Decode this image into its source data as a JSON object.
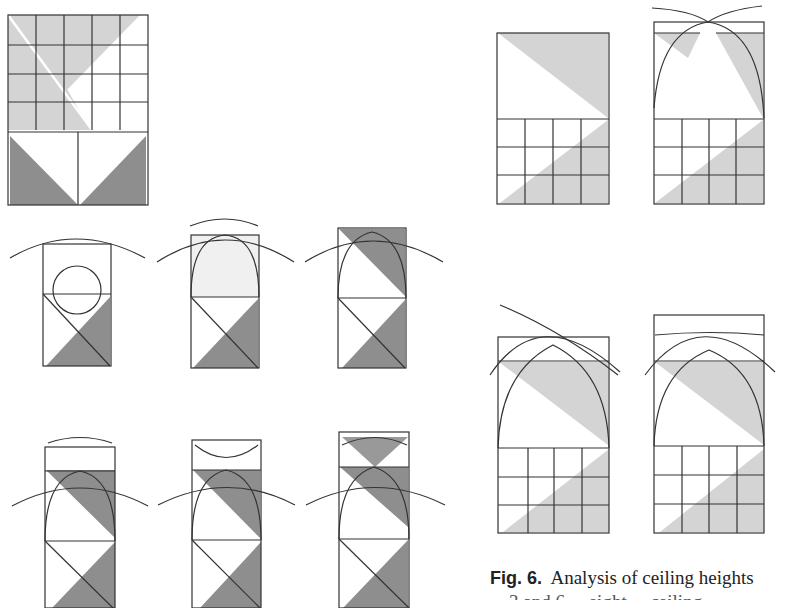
{
  "figure": {
    "label": "Fig. 6.",
    "caption_line1": "Analysis of ceiling heights",
    "caption_line2": "... 3 and 6 ... eight ... ceiling ...",
    "colors": {
      "line": "#333333",
      "light_shade": "#d3d3d3",
      "dark_shade": "#8c8c8c",
      "background": "#ffffff"
    },
    "panels": [
      {
        "id": "A",
        "description": "5x4 grid with light diagonal shading above two dark triangles"
      },
      {
        "id": "B1",
        "description": "rectangle with two arcs and lower dark triangle"
      },
      {
        "id": "B2",
        "description": "rectangle with arcs, light arch shading, dark triangle"
      },
      {
        "id": "B3",
        "description": "rectangle with arcs, dark upper wedge, dark triangle"
      },
      {
        "id": "C1",
        "description": "tall rectangle with arcs, dark wedge, dark triangle"
      },
      {
        "id": "C2",
        "description": "tall rectangle with arcs, dark wedge, dark triangle"
      },
      {
        "id": "C3",
        "description": "tall rectangle with crossed arcs, dark triangles top and bottom"
      },
      {
        "id": "D1",
        "description": "square over 4x3 grid with light diagonal shading"
      },
      {
        "id": "D2",
        "description": "arch over 4x3 grid with light shading"
      },
      {
        "id": "E1",
        "description": "arched rectangle over 4x3 grid, light diagonal shading"
      },
      {
        "id": "E2",
        "description": "arched rectangle over 4x3 grid, light diagonal shading"
      }
    ]
  }
}
